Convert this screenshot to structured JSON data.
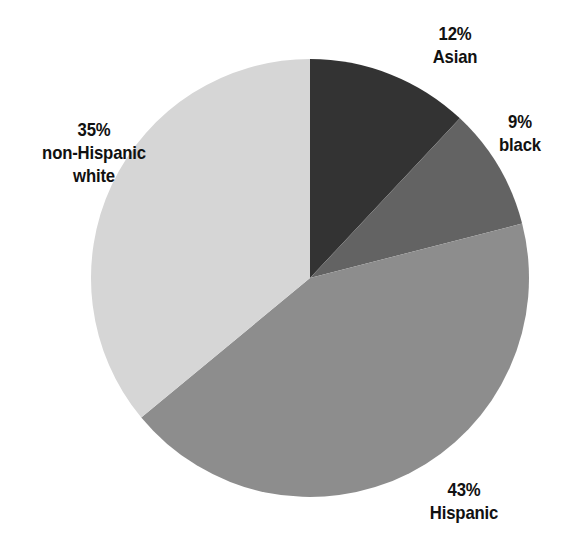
{
  "chart_data": {
    "type": "pie",
    "title": "",
    "subtitle": "",
    "xlabel": "",
    "ylabel": "",
    "legend": "none",
    "grid": false,
    "units": "percent",
    "start_angle_deg": 0,
    "direction": "clockwise",
    "categories": [
      "Asian",
      "black",
      "Hispanic",
      "non-Hispanic white"
    ],
    "values": [
      12,
      9,
      43,
      35
    ],
    "slices": [
      {
        "label": "Asian",
        "value": 12,
        "value_text": "12%",
        "color": "#333333",
        "start_deg": 0,
        "end_deg": 43.2,
        "label_lines": [
          "12%",
          "Asian"
        ]
      },
      {
        "label": "black",
        "value": 9,
        "value_text": "9%",
        "color": "#636363",
        "start_deg": 43.2,
        "end_deg": 75.6,
        "label_lines": [
          "9%",
          "black"
        ]
      },
      {
        "label": "Hispanic",
        "value": 43,
        "value_text": "43%",
        "color": "#8d8d8d",
        "start_deg": 75.6,
        "end_deg": 230.4,
        "label_lines": [
          "43%",
          "Hispanic"
        ]
      },
      {
        "label": "non-Hispanic white",
        "value": 35,
        "value_text": "35%",
        "color": "#d6d6d6",
        "start_deg": 230.4,
        "end_deg": 360,
        "label_lines": [
          "35%",
          "non-Hispanic",
          "white"
        ]
      }
    ]
  },
  "labels": {
    "asian": {
      "percent": "12%",
      "name": "Asian"
    },
    "black": {
      "percent": "9%",
      "name": "black"
    },
    "hispanic": {
      "percent": "43%",
      "name": "Hispanic"
    },
    "white": {
      "percent": "35%",
      "name_line1": "non-Hispanic",
      "name_line2": "white"
    }
  },
  "colors": {
    "asian": "#333333",
    "black": "#636363",
    "hispanic": "#8d8d8d",
    "white": "#d6d6d6",
    "background": "#ffffff",
    "text": "#111111"
  }
}
